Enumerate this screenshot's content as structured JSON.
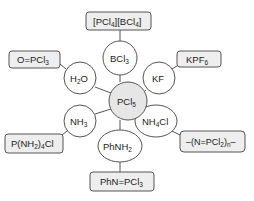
{
  "diagram": {
    "center": {
      "id": "PCl5",
      "label": "PCl",
      "sub": "5",
      "fill": "#e6e6e6"
    },
    "reagents": [
      {
        "id": "BCl3",
        "label": "BCl",
        "sub": "3"
      },
      {
        "id": "H2O",
        "label": "H",
        "sub": "2",
        "tail": "O"
      },
      {
        "id": "KF",
        "label": "KF",
        "sub": ""
      },
      {
        "id": "NH3",
        "label": "NH",
        "sub": "3"
      },
      {
        "id": "NH4Cl",
        "label": "NH",
        "sub": "4",
        "tail": "Cl"
      },
      {
        "id": "PhNH2",
        "label": "PhNH",
        "sub": "2"
      }
    ],
    "products": [
      {
        "id": "PCl4BCl4",
        "from": "BCl3",
        "parts": [
          "[PCl",
          "4",
          "][BCl",
          "4",
          "]"
        ]
      },
      {
        "id": "OPCl3",
        "from": "H2O",
        "parts": [
          "O=PCl",
          "3"
        ]
      },
      {
        "id": "KPF6",
        "from": "KF",
        "parts": [
          "KPF",
          "6"
        ]
      },
      {
        "id": "PNH24Cl",
        "from": "NH3",
        "parts": [
          "P(NH",
          "2",
          ")",
          "4",
          "Cl"
        ]
      },
      {
        "id": "NPCl2n",
        "from": "NH4Cl",
        "parts": [
          "–(N=PCl",
          "2",
          ")",
          "n",
          "–"
        ]
      },
      {
        "id": "PhNPCl3",
        "from": "PhNH2",
        "parts": [
          "PhN=PCl",
          "3"
        ]
      }
    ],
    "colors": {
      "box_fill": "#eeeeee",
      "circle_fill": "#ffffff",
      "stroke": "#555555"
    }
  }
}
